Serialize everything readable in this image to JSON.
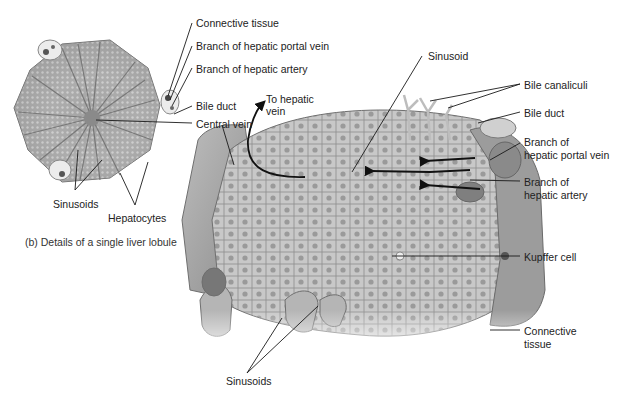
{
  "figure": {
    "caption": "(b) Details of a single liver lobule",
    "colors": {
      "background": "#ffffff",
      "tissue_light": "#d9d9d9",
      "tissue_mid": "#a8a8a8",
      "tissue_dark": "#7a7a7a",
      "label_text": "#222222",
      "leader_line": "#1a1a1a"
    }
  },
  "lobule_labels": {
    "connective_tissue": "Connective tissue",
    "portal_vein": "Branch of hepatic portal vein",
    "hepatic_artery": "Branch of hepatic artery",
    "bile_duct": "Bile duct",
    "central_vein": "Central vein",
    "sinusoids": "Sinusoids",
    "hepatocytes": "Hepatocytes"
  },
  "block_labels": {
    "to_hepatic_vein_line1": "To hepatic",
    "to_hepatic_vein_line2": "vein",
    "sinusoid": "Sinusoid",
    "bile_canaliculi": "Bile canaliculi",
    "bile_duct": "Bile duct",
    "portal_vein_line1": "Branch of",
    "portal_vein_line2": "hepatic portal vein",
    "hepatic_artery_line1": "Branch of",
    "hepatic_artery_line2": "hepatic artery",
    "kupffer_cell": "Kupffer cell",
    "connective_tissue_line1": "Connective",
    "connective_tissue_line2": "tissue",
    "sinusoids": "Sinusoids"
  }
}
